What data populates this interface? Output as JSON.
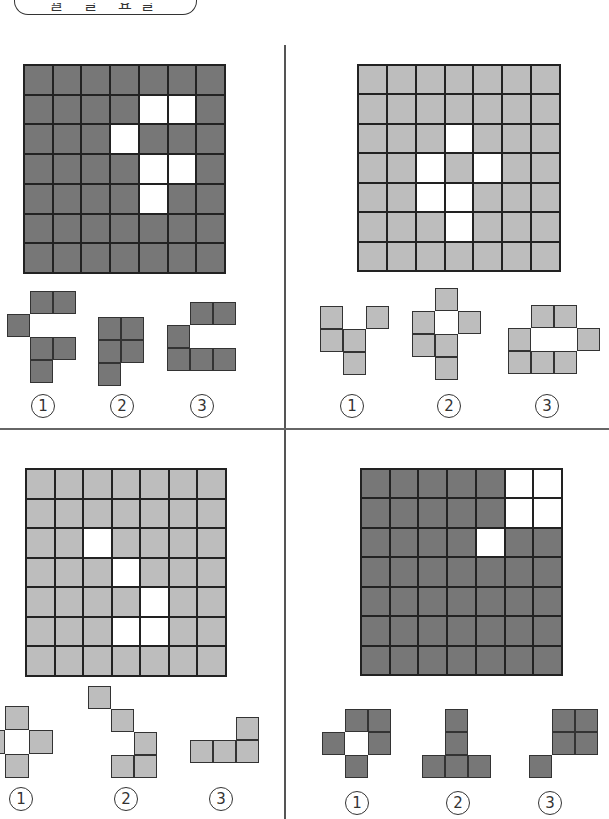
{
  "header": {
    "text": "월 일 요일"
  },
  "colors": {
    "dark": "#777777",
    "light": "#bdbdbd",
    "hole": "#ffffff",
    "line": "#222222"
  },
  "quadrants": [
    {
      "id": "top-left",
      "shade": "dark",
      "grid": {
        "x": 23,
        "y": 64,
        "w": 203,
        "h": 210,
        "rows": 7,
        "cols": 7,
        "holes": [
          [
            1,
            4
          ],
          [
            1,
            5
          ],
          [
            2,
            3
          ],
          [
            3,
            4
          ],
          [
            3,
            5
          ],
          [
            4,
            4
          ]
        ]
      },
      "pieces": [
        {
          "label": "1",
          "x": 7,
          "y": 291,
          "cell": 23,
          "cells": [
            [
              0,
              1
            ],
            [
              0,
              2
            ],
            [
              1,
              0
            ],
            [
              2,
              1
            ],
            [
              2,
              2
            ],
            [
              3,
              1
            ]
          ],
          "lx": 31,
          "ly": 394
        },
        {
          "label": "2",
          "x": 98,
          "y": 317,
          "cell": 23,
          "cells": [
            [
              0,
              0
            ],
            [
              0,
              1
            ],
            [
              1,
              0
            ],
            [
              1,
              1
            ],
            [
              2,
              0
            ]
          ],
          "lx": 110,
          "ly": 394
        },
        {
          "label": "3",
          "x": 167,
          "y": 302,
          "cell": 23,
          "cells": [
            [
              0,
              1
            ],
            [
              0,
              2
            ],
            [
              1,
              0
            ],
            [
              2,
              0
            ],
            [
              2,
              1
            ],
            [
              2,
              2
            ]
          ],
          "lx": 190,
          "ly": 394
        }
      ]
    },
    {
      "id": "top-right",
      "shade": "light",
      "grid": {
        "x": 357,
        "y": 64,
        "w": 204,
        "h": 208,
        "rows": 7,
        "cols": 7,
        "holes": [
          [
            2,
            3
          ],
          [
            3,
            2
          ],
          [
            3,
            4
          ],
          [
            4,
            2
          ],
          [
            4,
            3
          ],
          [
            5,
            3
          ]
        ]
      },
      "pieces": [
        {
          "label": "1",
          "x": 320,
          "y": 306,
          "cell": 23,
          "cells": [
            [
              0,
              0
            ],
            [
              0,
              2
            ],
            [
              1,
              0
            ],
            [
              1,
              1
            ],
            [
              2,
              1
            ]
          ],
          "lx": 340,
          "ly": 394
        },
        {
          "label": "2",
          "x": 412,
          "y": 288,
          "cell": 23,
          "cells": [
            [
              0,
              1
            ],
            [
              1,
              0
            ],
            [
              1,
              2
            ],
            [
              2,
              0
            ],
            [
              2,
              1
            ],
            [
              3,
              1
            ]
          ],
          "lx": 437,
          "ly": 394
        },
        {
          "label": "3",
          "x": 508,
          "y": 305,
          "cell": 23,
          "cells": [
            [
              0,
              1
            ],
            [
              0,
              2
            ],
            [
              1,
              0
            ],
            [
              1,
              3
            ],
            [
              2,
              0
            ],
            [
              2,
              1
            ],
            [
              2,
              2
            ]
          ],
          "lx": 535,
          "ly": 394
        }
      ]
    },
    {
      "id": "bottom-left",
      "shade": "light",
      "grid": {
        "x": 25,
        "y": 468,
        "w": 202,
        "h": 209,
        "rows": 7,
        "cols": 7,
        "holes": [
          [
            2,
            2
          ],
          [
            3,
            3
          ],
          [
            4,
            4
          ],
          [
            5,
            3
          ],
          [
            5,
            4
          ]
        ]
      },
      "pieces": [
        {
          "label": "1",
          "x": -19,
          "y": 706,
          "cell": 24,
          "cells": [
            [
              0,
              1
            ],
            [
              1,
              0
            ],
            [
              1,
              2
            ],
            [
              2,
              1
            ]
          ],
          "lx": 9,
          "ly": 787
        },
        {
          "label": "2",
          "x": 88,
          "y": 686,
          "cell": 23,
          "cells": [
            [
              0,
              0
            ],
            [
              1,
              1
            ],
            [
              2,
              2
            ],
            [
              3,
              1
            ],
            [
              3,
              2
            ]
          ],
          "lx": 114,
          "ly": 787
        },
        {
          "label": "3",
          "x": 190,
          "y": 717,
          "cell": 23,
          "cells": [
            [
              0,
              2
            ],
            [
              1,
              0
            ],
            [
              1,
              1
            ],
            [
              1,
              2
            ]
          ],
          "lx": 209,
          "ly": 787
        }
      ]
    },
    {
      "id": "bottom-right",
      "shade": "dark",
      "grid": {
        "x": 360,
        "y": 468,
        "w": 203,
        "h": 208,
        "rows": 7,
        "cols": 7,
        "holes": [
          [
            0,
            5
          ],
          [
            0,
            6
          ],
          [
            1,
            5
          ],
          [
            1,
            6
          ],
          [
            2,
            4
          ]
        ]
      },
      "pieces": [
        {
          "label": "1",
          "x": 322,
          "y": 709,
          "cell": 23,
          "cells": [
            [
              0,
              1
            ],
            [
              0,
              2
            ],
            [
              1,
              0
            ],
            [
              1,
              2
            ],
            [
              2,
              1
            ]
          ],
          "lx": 345,
          "ly": 791
        },
        {
          "label": "2",
          "x": 422,
          "y": 709,
          "cell": 23,
          "cells": [
            [
              0,
              1
            ],
            [
              1,
              1
            ],
            [
              2,
              0
            ],
            [
              2,
              1
            ],
            [
              2,
              2
            ]
          ],
          "lx": 446,
          "ly": 791
        },
        {
          "label": "3",
          "x": 529,
          "y": 709,
          "cell": 23,
          "cells": [
            [
              0,
              1
            ],
            [
              0,
              2
            ],
            [
              1,
              1
            ],
            [
              1,
              2
            ],
            [
              2,
              0
            ]
          ],
          "lx": 538,
          "ly": 791
        }
      ]
    }
  ],
  "label_glyphs": {
    "1": "1",
    "2": "2",
    "3": "3"
  }
}
